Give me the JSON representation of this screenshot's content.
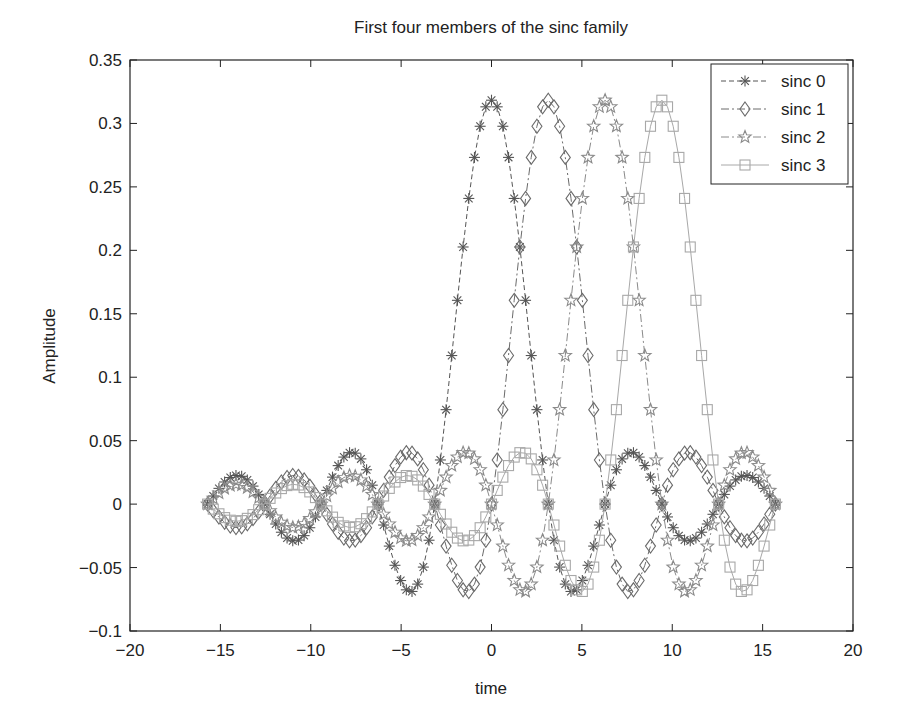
{
  "chart_data": {
    "type": "line",
    "title": "First four members of the sinc family",
    "xlabel": "time",
    "ylabel": "Amplitude",
    "xlim": [
      -20,
      20
    ],
    "ylim": [
      -0.1,
      0.35
    ],
    "xticks": [
      -20,
      -15,
      -10,
      -5,
      0,
      5,
      10,
      15,
      20
    ],
    "xtick_labels": [
      "−20",
      "−15",
      "−10",
      "−5",
      "0",
      "5",
      "10",
      "15",
      "20"
    ],
    "yticks": [
      -0.1,
      -0.05,
      0,
      0.05,
      0.1,
      0.15,
      0.2,
      0.25,
      0.3,
      0.35
    ],
    "ytick_labels": [
      "−0.1",
      "−0.05",
      "0",
      "0.05",
      "0.1",
      "0.15",
      "0.2",
      "0.25",
      "0.3",
      "0.35"
    ],
    "grid": false,
    "legend_position": "upper right",
    "t_range": [
      -15.708,
      15.708
    ],
    "num_points": 101,
    "formula": "y = sin(t - k*pi) / (pi * (t - k*pi)); y = 1/pi at t = k*pi",
    "series": [
      {
        "name": "sinc 0",
        "shift": 0,
        "marker": "asterisk",
        "line_style": "dashed",
        "color": "#555555",
        "peak_x": 0,
        "peak_y": 0.318
      },
      {
        "name": "sinc 1",
        "shift": 3.1416,
        "marker": "diamond",
        "line_style": "dashdot",
        "color": "#6a6a6a",
        "peak_x": 3.14,
        "peak_y": 0.318
      },
      {
        "name": "sinc 2",
        "shift": 6.2832,
        "marker": "star",
        "line_style": "dashdot",
        "color": "#8a8a8a",
        "peak_x": 6.28,
        "peak_y": 0.318
      },
      {
        "name": "sinc 3",
        "shift": 9.4248,
        "marker": "square",
        "line_style": "solid",
        "color": "#a8a8a8",
        "peak_x": 9.42,
        "peak_y": 0.318
      }
    ],
    "sample_points": {
      "x": [
        -15,
        -12.5,
        -10,
        -7.5,
        -5,
        -2.5,
        0,
        2.5,
        5,
        7.5,
        10,
        12.5,
        15
      ],
      "sinc 0": [
        -0.014,
        0.002,
        0.017,
        -0.04,
        0.061,
        0.076,
        0.318,
        0.076,
        -0.061,
        0.04,
        -0.017,
        -0.002,
        0.014
      ],
      "sinc 1": [
        0.017,
        -0.01,
        -0.006,
        0.007,
        -0.051,
        0.057,
        0.0,
        0.304,
        0.052,
        -0.046,
        0.031,
        -0.008,
        -0.014
      ],
      "sinc 2": [
        -0.004,
        0.016,
        -0.017,
        0.023,
        0.003,
        -0.044,
        0.0,
        0.053,
        0.3,
        0.044,
        -0.056,
        0.027,
        -0.005
      ],
      "sinc 3": [
        -0.014,
        -0.01,
        0.018,
        -0.009,
        -0.026,
        0.033,
        0.0,
        -0.006,
        0.064,
        0.268,
        0.076,
        -0.063,
        0.034
      ]
    }
  },
  "figure": {
    "width": 899,
    "height": 718,
    "plot_area": {
      "left": 130,
      "top": 60,
      "right": 853,
      "bottom": 631
    }
  }
}
